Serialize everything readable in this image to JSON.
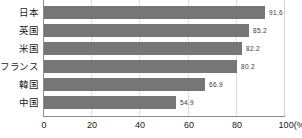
{
  "chart_data": {
    "type": "bar",
    "orientation": "horizontal",
    "title": "",
    "subtitle": "",
    "xlabel": "(%)",
    "ylabel": "",
    "categories": [
      "日本",
      "英国",
      "米国",
      "フランス",
      "韓国",
      "中国"
    ],
    "values": [
      91.6,
      85.2,
      82.2,
      80.2,
      66.9,
      54.9
    ],
    "value_labels": [
      "91.6",
      "85.2",
      "82.2",
      "80.2",
      "66.9",
      "54.9"
    ],
    "xlim": [
      0,
      100
    ],
    "xticks": [
      0,
      20,
      40,
      60,
      80,
      100
    ],
    "xtick_labels": [
      "0",
      "20",
      "40",
      "60",
      "80",
      "100(%)"
    ],
    "grid": true,
    "grid_axis": "x",
    "legend": null,
    "series": [
      {
        "name": "",
        "color": "#767676",
        "values": [
          91.6,
          85.2,
          82.2,
          80.2,
          66.9,
          54.9
        ]
      }
    ]
  },
  "colors": {
    "bar": "#767676",
    "axis": "#8c8c8c",
    "grid": "#dedede",
    "frame": "#d2d2d2",
    "text": "#1a1a1a",
    "value_text": "#3a3a3a",
    "background": "#ffffff"
  }
}
